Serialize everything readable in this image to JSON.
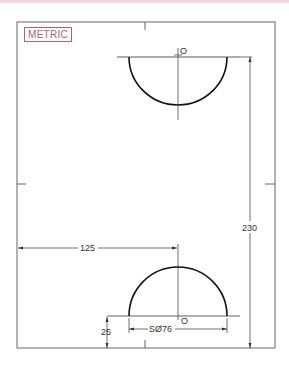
{
  "badge": {
    "label": "METRIC"
  },
  "dimensions": {
    "horizontal_offset": "125",
    "height_overall": "230",
    "bottom_offset": "25",
    "sphere_diameter": "SØ76"
  },
  "labels": {
    "top_center": "O",
    "bottom_center": "O"
  },
  "colors": {
    "line": "#222222",
    "frame": "#555555",
    "badge": "#b06070"
  }
}
